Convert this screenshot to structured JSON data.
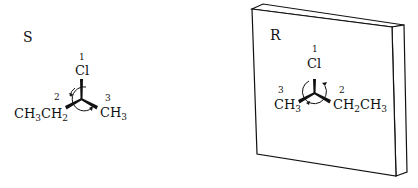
{
  "left_molecule": {
    "configuration": "S",
    "substituents": [
      {
        "priority": "1",
        "group": "Cl"
      },
      {
        "priority": "2",
        "group": "CH3CH2"
      },
      {
        "priority": "3",
        "group": "CH3"
      }
    ],
    "rotation": "counterclockwise"
  },
  "right_molecule": {
    "configuration": "R",
    "substituents": [
      {
        "priority": "1",
        "group": "Cl"
      },
      {
        "priority": "2",
        "group": "CH2CH3"
      },
      {
        "priority": "3",
        "group": "CH3"
      }
    ],
    "rotation": "clockwise"
  },
  "mirror": {
    "label": "mirror plane"
  },
  "text": {
    "S": "S",
    "R": "R",
    "p1": "1",
    "p2": "2",
    "p3": "3",
    "Cl": "Cl",
    "CH": "CH",
    "sub3": "3",
    "sub2": "2"
  }
}
